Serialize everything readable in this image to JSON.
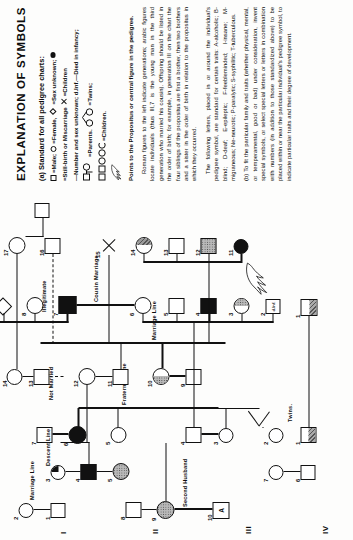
{
  "legend": {
    "title": "EXPLANATION OF SYMBOLS",
    "section_a_head": "(a) Standard for all pedigree charts:",
    "key_male": "=Male;",
    "key_female": "=Female,",
    "key_sex_unknown": "=Sex unknown;",
    "key_stillbirth": "=Still-birth or Miscarriage",
    "key_children_x": "=Children",
    "key_number_sex": "—Number and sex unknown; d.Inf.—Died in infancy;",
    "key_parents": "=Parents.",
    "key_twins": "=Twins;",
    "key_children": "=Children.",
    "key_pointer": "Points to the Propositus or central figure in the pedigree.",
    "para_1": "Roman figures to the left indicate generations; arabic figures locate individuals (thus III,7 is the young man in the third generation who married his cousin). Offspring should be listed in the order of birth; for example, in generation III on the chart the four siblings of the propositus are first a brother, then two brothers and a sister in the order of birth in relation to the propositus in which they occurred.",
    "para_2": "The following letters, placed in or around the individual's pedigree symbol, are standard for certain traits: A-alcoholic; B-blind; D-deaf; E-epileptic; F-feebleminded; I-insane; M-migraneous; Ne-neurotic; P-paralytic; S-syphilitic; T-tuberculous.",
    "section_b": "(b) To fit the particular family and traits (whether physical, mental, or temperamental, good or bad) under consideration, invent special symbols, or select special letters or letters in combination with numbers (in addition to those standardized above) to be placed within or near the particular individual's pedigree symbol, to indicate particular traits and their degree of development."
  },
  "pedigree": {
    "generations": [
      "I",
      "II",
      "III",
      "IV"
    ],
    "labels": {
      "marriage_line": "Marriage Line",
      "descent_line": "Descent Line",
      "fraternity_line": "Fraternity Line",
      "twins": "Twins.",
      "cousin_marriage": "Cousin Marriage",
      "second_husband": "Second Husband",
      "not_married": "Not Married",
      "illegitimate": "Illegitimate",
      "marriage_line_2": "Marriage Line",
      "d_inf": "d.Inf.",
      "alcoholic_letter": "A"
    },
    "gen1": [
      {
        "id": "1",
        "shape": "male",
        "fill": "none"
      },
      {
        "id": "2",
        "shape": "female",
        "fill": "none"
      },
      {
        "id": "3",
        "shape": "female",
        "fill": "quarter"
      },
      {
        "id": "4",
        "shape": "male",
        "fill": "solid"
      },
      {
        "id": "5",
        "shape": "female",
        "fill": "dot"
      },
      {
        "id": "6",
        "shape": "male",
        "fill": "none"
      },
      {
        "id": "7",
        "shape": "female",
        "fill": "none"
      },
      {
        "id": "8",
        "shape": "male",
        "fill": "none"
      },
      {
        "id": "9",
        "shape": "female",
        "fill": "dot"
      },
      {
        "id": "10",
        "shape": "male",
        "fill": "none",
        "letter": "A"
      }
    ],
    "gen2": [
      {
        "id": "1",
        "shape": "male",
        "fill": "half-hatch"
      },
      {
        "id": "2",
        "shape": "female",
        "fill": "none"
      },
      {
        "id": "3",
        "shape": "female",
        "fill": "none"
      },
      {
        "id": "4",
        "shape": "male",
        "fill": "none"
      },
      {
        "id": "5",
        "shape": "female",
        "fill": "none"
      },
      {
        "id": "6",
        "shape": "female",
        "fill": "solid"
      },
      {
        "id": "7",
        "shape": "male",
        "fill": "none"
      },
      {
        "id": "8",
        "shape": "female",
        "fill": "none"
      },
      {
        "id": "9",
        "shape": "male",
        "fill": "none"
      },
      {
        "id": "10",
        "shape": "female",
        "fill": "dot-half"
      },
      {
        "id": "11",
        "shape": "male",
        "fill": "none"
      },
      {
        "id": "12",
        "shape": "female",
        "fill": "none"
      },
      {
        "id": "13",
        "shape": "male",
        "fill": "none"
      },
      {
        "id": "14",
        "shape": "female",
        "fill": "none"
      }
    ],
    "gen3": [
      {
        "id": "1",
        "shape": "male",
        "fill": "split-hatch"
      },
      {
        "id": "2",
        "shape": "male",
        "fill": "none",
        "text": "d.Inf."
      },
      {
        "id": "3",
        "shape": "female",
        "fill": "half-dot"
      },
      {
        "id": "4",
        "shape": "male",
        "fill": "solid"
      },
      {
        "id": "5",
        "shape": "male",
        "fill": "none"
      },
      {
        "id": "6",
        "shape": "female",
        "fill": "none"
      },
      {
        "id": "7",
        "shape": "male",
        "fill": "solid"
      },
      {
        "id": "8",
        "shape": "female",
        "fill": "none"
      },
      {
        "id": "9",
        "shape": "diamond",
        "fill": "none"
      },
      {
        "id": "10",
        "shape": "male",
        "fill": "none"
      },
      {
        "id": "11",
        "shape": "female",
        "fill": "solid"
      },
      {
        "id": "12",
        "shape": "male",
        "fill": "dot"
      },
      {
        "id": "13",
        "shape": "male",
        "fill": "none"
      },
      {
        "id": "14",
        "shape": "female",
        "fill": "half-hatch"
      },
      {
        "id": "15",
        "shape": "stillbirth",
        "fill": "none"
      },
      {
        "id": "16",
        "shape": "male",
        "fill": "none"
      },
      {
        "id": "17",
        "shape": "female",
        "fill": "none"
      }
    ]
  }
}
